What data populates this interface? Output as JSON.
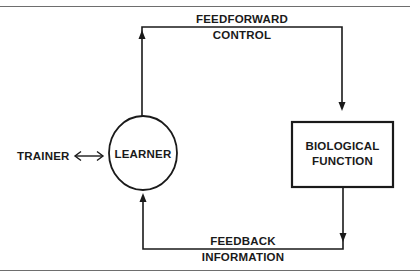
{
  "diagram": {
    "type": "feedback-loop",
    "nodes": {
      "trainer": {
        "label": "TRAINER"
      },
      "learner": {
        "label": "LEARNER",
        "shape": "circle"
      },
      "biological_function": {
        "label_line1": "BIOLOGICAL",
        "label_line2": "FUNCTION",
        "shape": "rectangle"
      }
    },
    "edges": {
      "feedforward": {
        "label_line1": "FEEDFORWARD",
        "label_line2": "CONTROL",
        "from": "LEARNER",
        "to": "BIOLOGICAL FUNCTION"
      },
      "feedback": {
        "label_line1": "FEEDBACK",
        "label_line2": "INFORMATION",
        "from": "BIOLOGICAL FUNCTION",
        "to": "LEARNER"
      },
      "trainer_learner": {
        "from": "TRAINER",
        "to": "LEARNER",
        "direction": "bidirectional"
      }
    },
    "colors": {
      "ink": "#1a1a1a",
      "rule": "#6e6e6e",
      "background": "#ffffff"
    }
  }
}
